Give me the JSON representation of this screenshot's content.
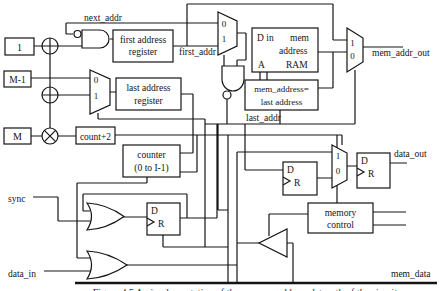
{
  "labels": {
    "one": "1",
    "m_minus_1": "M-1",
    "m": "M",
    "count_plus_2": "count+2",
    "first_reg_l1": "first address",
    "first_reg_l2": "register",
    "last_reg_l1": "last address",
    "last_reg_l2": "register",
    "counter_l1": "counter",
    "counter_l2": "(0 to I-1)",
    "cmp_l1": "mem_address=",
    "cmp_l2": "last address",
    "memctl_l1": "memory",
    "memctl_l2": "control",
    "ram_din": "D in",
    "ram_mem": "mem",
    "ram_address": "address",
    "ram_a": "A",
    "ram_name": "RAM",
    "mux_zero": "0",
    "mux_one": "1",
    "ff_d": "D",
    "ff_r": "R"
  },
  "wire_labels": {
    "next_addr": "next_addr",
    "first_addr": "first_addr",
    "last_addr": "last_addr",
    "mem_addr_out": "mem_addr_out",
    "data_out": "data_out",
    "mem_data": "mem_data",
    "sync": "sync",
    "data_in": "data_in"
  },
  "caption": "Figure 4.5 An implementation of the memory address datapath of the circuit"
}
